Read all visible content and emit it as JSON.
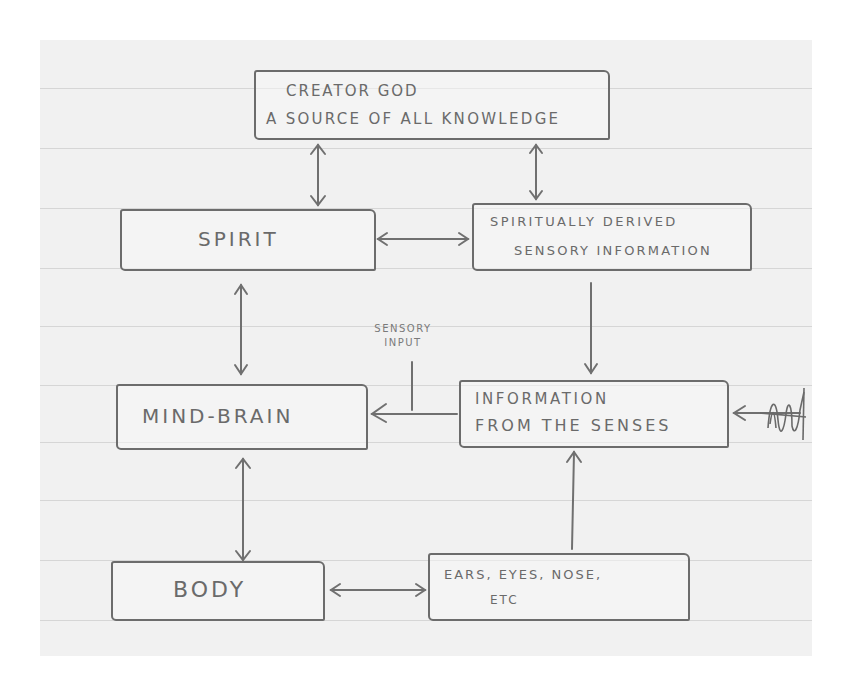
{
  "diagram": {
    "style": "hand-drawn pencil sketch on lined notebook paper",
    "colors": {
      "paper": "#f1f1f1",
      "ink": "#6c6c6c",
      "rule_lines": "#d6d6d6",
      "background": "#ffffff"
    },
    "nodes": {
      "creator": {
        "line1": "CREATOR GOD",
        "line2": "A SOURCE OF ALL KNOWLEDGE"
      },
      "spirit": {
        "label": "SPIRIT"
      },
      "spiritual_info": {
        "line1": "SPIRITUALLY DERIVED",
        "line2": "SENSORY INFORMATION"
      },
      "mind_brain": {
        "label": "MIND-BRAIN"
      },
      "info_senses": {
        "line1": "INFORMATION",
        "line2": "FROM THE SENSES"
      },
      "body": {
        "label": "BODY"
      },
      "organs": {
        "line1": "EARS, EYES, NOSE,",
        "line2": "ETC"
      }
    },
    "annotations": {
      "sensory_input": {
        "line1": "SENSORY",
        "line2": "INPUT"
      }
    },
    "edges": [
      {
        "from": "creator",
        "to": "spirit",
        "type": "bidirectional"
      },
      {
        "from": "creator",
        "to": "spiritual_info",
        "type": "bidirectional"
      },
      {
        "from": "spirit",
        "to": "spiritual_info",
        "type": "bidirectional"
      },
      {
        "from": "spirit",
        "to": "mind_brain",
        "type": "bidirectional"
      },
      {
        "from": "spiritual_info",
        "to": "info_senses",
        "type": "directed"
      },
      {
        "from": "info_senses",
        "to": "mind_brain",
        "type": "directed",
        "label": "SENSORY INPUT"
      },
      {
        "from": "external_scribble",
        "to": "info_senses",
        "type": "directed"
      },
      {
        "from": "mind_brain",
        "to": "body",
        "type": "bidirectional"
      },
      {
        "from": "body",
        "to": "organs",
        "type": "bidirectional"
      },
      {
        "from": "organs",
        "to": "info_senses",
        "type": "directed"
      }
    ]
  }
}
